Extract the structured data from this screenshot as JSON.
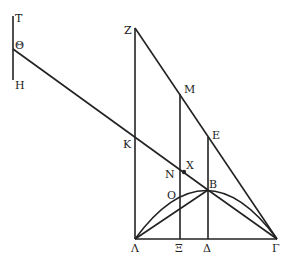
{
  "diagram": {
    "type": "geometric-figure",
    "stroke_color": "#222222",
    "background": "#ffffff",
    "labels": {
      "T": "T",
      "Theta": "Θ",
      "H": "H",
      "Z": "Z",
      "M": "M",
      "E": "E",
      "K": "K",
      "X": "X",
      "N": "N",
      "O": "O",
      "B": "B",
      "Lambda": "Λ",
      "Xi": "Ξ",
      "Delta": "Δ",
      "Gamma": "Γ"
    }
  }
}
